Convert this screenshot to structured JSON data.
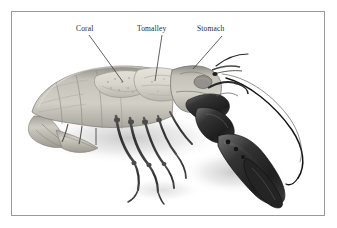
{
  "figure": {
    "background_color": "#ffffff",
    "frame_color": "#9a9a9a",
    "label_color": "#2a2a2a",
    "shadow_color": "#c9c9c9"
  },
  "annotations": [
    {
      "id": "coral",
      "label": "Coral",
      "label_x": 76,
      "label_y": 24,
      "leader_from_x": 89,
      "leader_from_y": 35,
      "leader_to_x": 123,
      "leader_to_y": 82
    },
    {
      "id": "tomalley",
      "label": "Tomalley",
      "label_x": 137,
      "label_y": 24,
      "leader_from_x": 162,
      "leader_from_y": 35,
      "leader_to_x": 155,
      "leader_to_y": 81
    },
    {
      "id": "stomach",
      "label": "Stomach",
      "label_x": 197,
      "label_y": 24,
      "leader_from_x": 222,
      "leader_from_y": 36,
      "leader_to_x": 193,
      "leader_to_y": 69
    }
  ],
  "specimen": {
    "name": "lobster",
    "orientation": "tail-left-claw-right",
    "parts": [
      {
        "name": "tail-fan",
        "tone": "#b9b7b0"
      },
      {
        "name": "abdomen",
        "tone": "#c2bfb6"
      },
      {
        "name": "carapace",
        "tone": "#bab7ae"
      },
      {
        "name": "coral-mass",
        "tone": "#d6d3cb"
      },
      {
        "name": "tomalley-mass",
        "tone": "#dedbd3"
      },
      {
        "name": "stomach-sac",
        "tone": "#8f8d87"
      },
      {
        "name": "walking-legs",
        "tone": "#3a3a3a"
      },
      {
        "name": "large-claw",
        "tone": "#2b2b2b"
      },
      {
        "name": "small-claw",
        "tone": "#3d3d3d"
      },
      {
        "name": "antenna-long",
        "tone": "#1c1c1c"
      },
      {
        "name": "antenna-short",
        "tone": "#2c2c2c"
      }
    ]
  }
}
